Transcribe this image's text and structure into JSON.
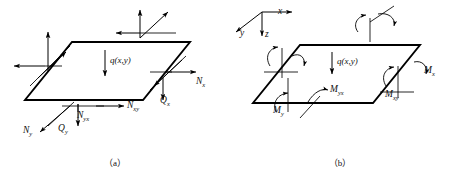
{
  "figure": {
    "panels": [
      {
        "id": "a",
        "caption": "（a）",
        "load_label": "q(x,y)",
        "labels": [
          {
            "name": "N_x",
            "base": "N",
            "sub": "x",
            "x": 196,
            "y": 84
          },
          {
            "name": "Q_x",
            "base": "Q",
            "sub": "x",
            "x": 160,
            "y": 103
          },
          {
            "name": "N_xy",
            "base": "N",
            "sub": "xy",
            "x": 127,
            "y": 108
          },
          {
            "name": "N_yx",
            "base": "N",
            "sub": "yx",
            "x": 77,
            "y": 118
          },
          {
            "name": "Q_y",
            "base": "Q",
            "sub": "y",
            "x": 58,
            "y": 131
          },
          {
            "name": "N_y",
            "base": "N",
            "sub": "y",
            "x": 23,
            "y": 133
          }
        ]
      },
      {
        "id": "b",
        "caption": "（b）",
        "load_label": "q(x,y)",
        "axes": [
          {
            "name": "x",
            "x": 278,
            "y": 14
          },
          {
            "name": "y",
            "x": 240,
            "y": 36
          },
          {
            "name": "z",
            "x": 263,
            "y": 36
          }
        ],
        "labels": [
          {
            "name": "M_x",
            "base": "M",
            "sub": "x",
            "x": 424,
            "y": 73
          },
          {
            "name": "M_xy",
            "base": "M",
            "sub": "xy",
            "x": 385,
            "y": 97
          },
          {
            "name": "M_yx",
            "base": "M",
            "sub": "yx",
            "x": 330,
            "y": 92
          },
          {
            "name": "M_y",
            "base": "M",
            "sub": "y",
            "x": 273,
            "y": 113
          }
        ]
      }
    ],
    "colors": {
      "ink": "#111111",
      "plate": "#000000",
      "background": "#ffffff"
    }
  }
}
